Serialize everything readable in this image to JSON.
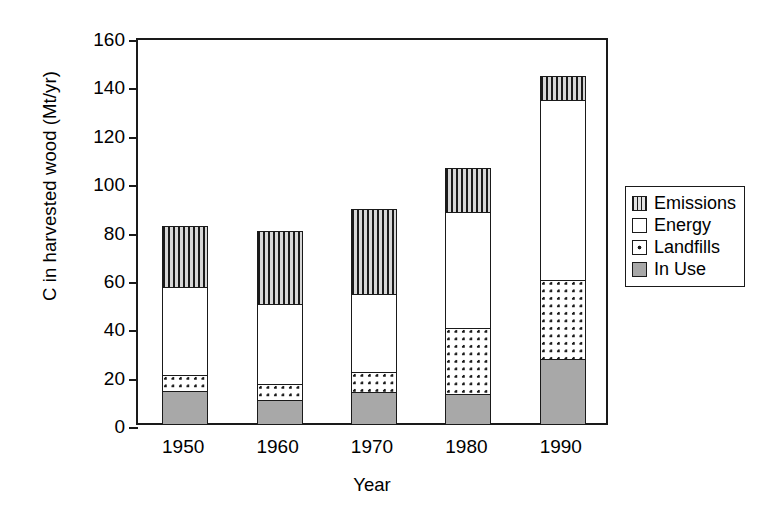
{
  "chart_data": {
    "type": "bar",
    "subtype": "stacked-vertical",
    "title": "",
    "xlabel": "Year",
    "ylabel": "C in harvested wood (Mt/yr)",
    "categories": [
      "1950",
      "1960",
      "1970",
      "1980",
      "1990"
    ],
    "ylim": [
      0,
      160
    ],
    "yticks": [
      0,
      20,
      40,
      60,
      80,
      100,
      120,
      140,
      160
    ],
    "ytick_labels": [
      "0",
      "20",
      "40",
      "60",
      "80",
      "100",
      "120",
      "140",
      "160"
    ],
    "grid": false,
    "legend_position": "right",
    "series": [
      {
        "name": "In Use",
        "pattern": "solid-gray",
        "color": "#a8a8a8",
        "values": [
          14.0,
          10.0,
          13.5,
          12.5,
          27.0
        ]
      },
      {
        "name": "Landfills",
        "pattern": "dotted",
        "color": "#ffffff",
        "values": [
          7.0,
          7.5,
          9.0,
          28.0,
          33.5
        ]
      },
      {
        "name": "Energy",
        "pattern": "empty-white",
        "color": "#ffffff",
        "values": [
          37.0,
          33.5,
          32.5,
          48.5,
          75.0
        ]
      },
      {
        "name": "Emissions",
        "pattern": "vertical-stripes",
        "color": "#d6d6d6",
        "values": [
          26.0,
          31.0,
          36.0,
          19.0,
          10.5
        ]
      }
    ],
    "cumulative_tops": {
      "In Use": [
        14.0,
        10.0,
        13.5,
        12.5,
        27.0
      ],
      "Landfills": [
        21.0,
        17.5,
        22.5,
        40.5,
        60.5
      ],
      "Energy": [
        58.0,
        51.0,
        55.0,
        89.0,
        135.5
      ],
      "Emissions": [
        84.0,
        82.0,
        91.0,
        108.0,
        146.0
      ]
    },
    "totals": [
      84.0,
      82.0,
      91.0,
      108.0,
      146.0
    ]
  },
  "legend": {
    "items": [
      {
        "label": "Emissions",
        "swatch": "emissions-swatch-icon"
      },
      {
        "label": "Energy",
        "swatch": "energy-swatch-icon"
      },
      {
        "label": "Landfills",
        "swatch": "landfills-swatch-icon"
      },
      {
        "label": "In Use",
        "swatch": "in-use-swatch-icon"
      }
    ]
  },
  "colors": {
    "axis": "#1a1a1a",
    "in_use": "#a8a8a8",
    "emissions_base": "#d6d6d6",
    "background": "#ffffff"
  }
}
